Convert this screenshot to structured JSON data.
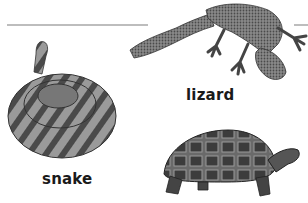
{
  "labels": {
    "lizard": "lizard",
    "snake": "snake"
  },
  "illustrations": [
    {
      "name": "lizard",
      "style": "grayscale stippled drawing"
    },
    {
      "name": "snake",
      "style": "grayscale coiled rattlesnake drawing"
    },
    {
      "name": "tortoise",
      "style": "grayscale tortoise drawing"
    }
  ],
  "colors": {
    "rule": "#bdbdbd",
    "text": "#1a1a1a"
  }
}
